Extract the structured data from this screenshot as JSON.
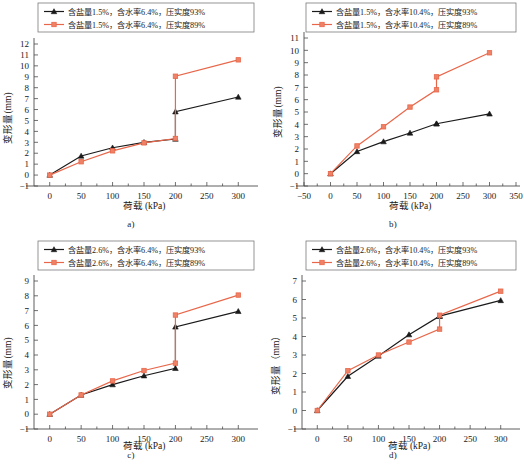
{
  "figure": {
    "panels": [
      {
        "id": "a",
        "caption": "a)",
        "chart_data": {
          "type": "line",
          "title": "",
          "xlabel": "荷载 (kPa)",
          "ylabel": "变形量(mm)",
          "xlim": [
            -25,
            325
          ],
          "ylim": [
            -1,
            12
          ],
          "xticks": [
            0,
            50,
            100,
            150,
            200,
            250,
            300
          ],
          "yticks": [
            -1,
            0,
            1,
            2,
            3,
            4,
            5,
            6,
            7,
            8,
            9,
            10,
            11,
            12
          ],
          "grid": false,
          "legend_position": "top-center",
          "x": [
            0,
            50,
            100,
            150,
            200,
            200,
            300
          ],
          "series": [
            {
              "name": "含盐量1.5%，含水率6.4%，压实度93%",
              "color": "#1a1a1a",
              "marker": "triangle",
              "values": [
                0,
                1.75,
                2.5,
                3.0,
                3.3,
                5.8,
                7.15
              ]
            },
            {
              "name": "含盐量1.5%，含水率6.4%，压实度89%",
              "color": "#e8674a",
              "marker": "square",
              "values": [
                0,
                1.22,
                2.22,
                2.95,
                3.35,
                9.05,
                10.55
              ]
            }
          ]
        }
      },
      {
        "id": "b",
        "caption": "b)",
        "chart_data": {
          "type": "line",
          "title": "",
          "xlabel": "荷载 (kPa)",
          "ylabel": "变形量(mm)",
          "xlim": [
            -50,
            350
          ],
          "ylim": [
            -1,
            11
          ],
          "xticks": [
            -50,
            0,
            50,
            100,
            150,
            200,
            250,
            300,
            350
          ],
          "yticks": [
            -1,
            0,
            1,
            2,
            3,
            4,
            5,
            6,
            7,
            8,
            9,
            10,
            11
          ],
          "grid": false,
          "legend_position": "top-center",
          "x": [
            0,
            50,
            100,
            150,
            200,
            200,
            300
          ],
          "series": [
            {
              "name": "含盐量1.5%，含水率10.4%，压实度93%",
              "color": "#1a1a1a",
              "marker": "triangle",
              "values": [
                0,
                1.8,
                2.6,
                3.3,
                4.05,
                4.05,
                4.85
              ]
            },
            {
              "name": "含盐量1.5%，含水率10.4%，压实度89%",
              "color": "#e8674a",
              "marker": "square",
              "values": [
                0,
                2.25,
                3.8,
                5.4,
                6.8,
                7.85,
                9.8
              ]
            }
          ]
        }
      },
      {
        "id": "c",
        "caption": "c)",
        "chart_data": {
          "type": "line",
          "title": "",
          "xlabel": "荷载 (kPa)",
          "ylabel": "变形量(mm)",
          "xlim": [
            -25,
            325
          ],
          "ylim": [
            -1,
            9
          ],
          "xticks": [
            0,
            50,
            100,
            150,
            200,
            250,
            300
          ],
          "yticks": [
            -1,
            0,
            1,
            2,
            3,
            4,
            5,
            6,
            7,
            8,
            9
          ],
          "grid": false,
          "legend_position": "top-center",
          "x": [
            0,
            50,
            100,
            150,
            200,
            200,
            300
          ],
          "series": [
            {
              "name": "含盐量2.6%，含水率6.4%，压实度93%",
              "color": "#1a1a1a",
              "marker": "triangle",
              "values": [
                0,
                1.3,
                2.0,
                2.6,
                3.1,
                5.9,
                6.95
              ]
            },
            {
              "name": "含盐量2.6%，含水率6.4%，压实度89%",
              "color": "#e8674a",
              "marker": "square",
              "values": [
                0,
                1.3,
                2.25,
                2.95,
                3.45,
                6.7,
                8.05
              ]
            }
          ]
        }
      },
      {
        "id": "d",
        "caption": "d)",
        "chart_data": {
          "type": "line",
          "title": "",
          "xlabel": "荷载 (kPa)",
          "ylabel": "变形量（mm）",
          "xlim": [
            -25,
            325
          ],
          "ylim": [
            -1,
            7
          ],
          "xticks": [
            0,
            50,
            100,
            150,
            200,
            250,
            300
          ],
          "yticks": [
            -1,
            0,
            1,
            2,
            3,
            4,
            5,
            6,
            7
          ],
          "grid": false,
          "legend_position": "top-center",
          "x": [
            0,
            50,
            100,
            150,
            200,
            200,
            300
          ],
          "series": [
            {
              "name": "含盐量2.6%，含水率10.4%，压实度93%",
              "color": "#1a1a1a",
              "marker": "triangle",
              "values": [
                0,
                1.85,
                2.95,
                4.1,
                5.1,
                5.1,
                5.95
              ]
            },
            {
              "name": "含盐量2.6%，含水率10.4%，压实度89%",
              "color": "#e8674a",
              "marker": "square",
              "values": [
                0,
                2.15,
                3.0,
                3.7,
                4.4,
                5.15,
                6.45
              ]
            }
          ]
        }
      }
    ]
  }
}
